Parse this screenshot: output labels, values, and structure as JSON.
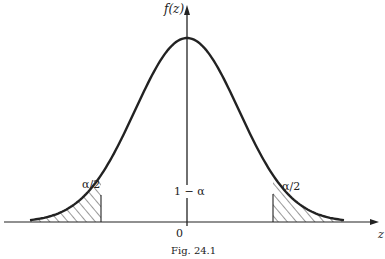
{
  "figure": {
    "y_axis_label": "f(z)",
    "x_axis_label": "z",
    "origin_label": "0",
    "left_tail_label": "α/2",
    "right_tail_label": "α/2",
    "center_label": "1 − α",
    "caption": "Fig. 24.1"
  },
  "colors": {
    "ink": "#222222",
    "background": "#ffffff"
  }
}
